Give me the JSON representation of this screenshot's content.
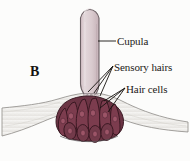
{
  "figure": {
    "panel_letter": "B",
    "background_color": "#fcfcfb",
    "width": 190,
    "height": 161
  },
  "labels": {
    "cupula": "Cupula",
    "sensory_hairs": "Sensory hairs",
    "hair_cells": "Hair cells"
  },
  "colors": {
    "cupula_fill": "#d6c6ca",
    "cupula_fill_light": "#e2d6d9",
    "cupula_outline": "#6b6064",
    "hair_cell_fill": "#7c3c4e",
    "hair_cell_fill_dark": "#63303f",
    "hair_cell_outline": "#3d1c26",
    "nucleus_fill": "#8e4a5c",
    "epithelium_fill": "#f2f1ef",
    "epithelium_outline": "#8d8a86",
    "sensory_hair_fill": "#e7dfe0",
    "leader_line": "#15120f",
    "text": "#1c1a18"
  },
  "structures": {
    "cupula": {
      "name": "cupula",
      "description": "rounded-top vertical gelatinous column",
      "top_y": 7,
      "bottom_y": 92,
      "left_x": 80,
      "right_x": 99
    },
    "hair_cells": {
      "name": "hair-cells",
      "description": "fan of teardrop sensory hair cells with nuclei",
      "count": 10
    },
    "sensory_hairs": {
      "name": "sensory-hairs",
      "description": "fine filaments from hair cell apices into cupula base"
    },
    "epithelium": {
      "name": "epithelium",
      "description": "pale textured tissue band across the base"
    }
  }
}
